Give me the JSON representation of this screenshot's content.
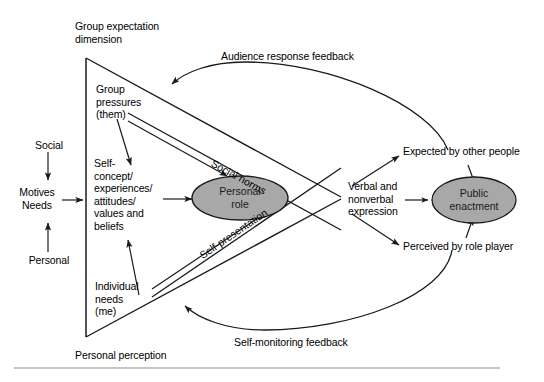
{
  "figure": {
    "type": "diagram",
    "title_top_left": "Group expectation\ndimension",
    "title_bottom_left": "Personal perception",
    "background_color": "#ffffff",
    "line_color": "#1a1a1a",
    "node_fill": "#a8a8a8",
    "text_color": "#000000"
  },
  "axis_labels": {
    "social": "Social",
    "personal": "Personal",
    "motives_needs": "Motives\nNeeds"
  },
  "inputs": {
    "group_pressures": "Group\npressures\n(them)",
    "self_concept": "Self-\nconcept/\nexperiences/\nattitudes/\nvalues and\nbeliefs",
    "individual_needs": "Individual\nneeds\n(me)"
  },
  "nodes": [
    {
      "id": "personal-role",
      "label": "Personal\nrole",
      "shape": "ellipse",
      "fill": "#a8a8a8"
    },
    {
      "id": "public-enactment",
      "label": "Public\nenactment",
      "shape": "ellipse",
      "fill": "#a8a8a8"
    }
  ],
  "channel_labels": {
    "social_norms": "Social norms",
    "self_presentation": "Self-presentation"
  },
  "expression": {
    "verbal_nonverbal": "Verbal and\nnonverbal\nexpression",
    "expected": "Expected by other people",
    "perceived": "Perceived by role player"
  },
  "feedback": {
    "audience": "Audience response feedback",
    "self_monitoring": "Self-monitoring feedback"
  }
}
